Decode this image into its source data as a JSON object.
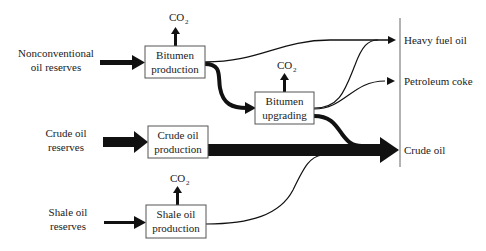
{
  "diagram": {
    "colors": {
      "ink": "#111111",
      "box_border": "#555555",
      "text": "#222222",
      "background": "#ffffff"
    },
    "sources": [
      {
        "id": "nonconventional",
        "line1": "Nonconventional",
        "line2": "oil reserves"
      },
      {
        "id": "crude",
        "line1": "Crude oil",
        "line2": "reserves"
      },
      {
        "id": "shale",
        "line1": "Shale oil",
        "line2": "reserves"
      }
    ],
    "processes": [
      {
        "id": "bitumen_production",
        "line1": "Bitumen",
        "line2": "production",
        "emits": "CO",
        "emits_sub": "2"
      },
      {
        "id": "bitumen_upgrading",
        "line1": "Bitumen",
        "line2": "upgrading",
        "emits": "CO",
        "emits_sub": "2"
      },
      {
        "id": "crude_oil_production",
        "line1": "Crude oil",
        "line2": "production"
      },
      {
        "id": "shale_oil_production",
        "line1": "Shale oil",
        "line2": "production",
        "emits": "CO",
        "emits_sub": "2"
      }
    ],
    "products": [
      {
        "id": "heavy_fuel_oil",
        "label": "Heavy fuel oil"
      },
      {
        "id": "petroleum_coke",
        "label": "Petroleum coke"
      },
      {
        "id": "crude_oil",
        "label": "Crude oil"
      }
    ]
  }
}
